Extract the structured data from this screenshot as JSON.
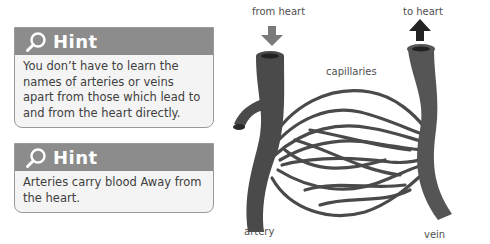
{
  "hints": [
    {
      "title": "Hint",
      "icon": "magnifier-icon",
      "text": "You don’t have to learn the names of arteries or veins apart from those which lead to and from the heart directly."
    },
    {
      "title": "Hint",
      "icon": "magnifier-icon",
      "text": "Arteries carry blood Away from the heart."
    }
  ],
  "diagram": {
    "labels": {
      "from_heart": "from heart",
      "to_heart": "to heart",
      "capillaries": "capillaries",
      "artery": "artery",
      "vein": "vein"
    },
    "colors": {
      "vessel": "#4a4a4a",
      "arrow_in": "#7a7a7a",
      "arrow_out": "#222222",
      "hint_header": "#8c8c8c",
      "hint_body": "#f4f4f4"
    }
  }
}
